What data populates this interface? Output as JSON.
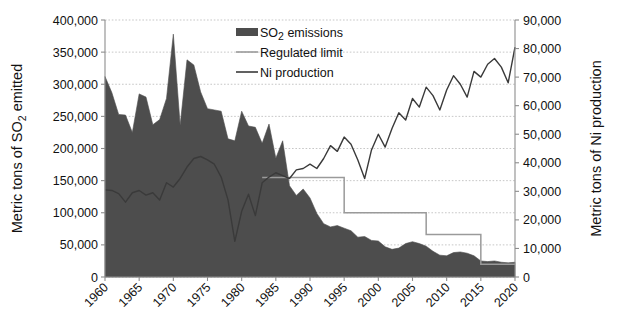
{
  "chart_data": {
    "type": "area",
    "title": "",
    "xlabel": "",
    "ylabel": "Metric tons of SO2 emitted",
    "ylabel_html": "Metric tons of SO₂ emitted",
    "y2label": "Metric tons of Ni production",
    "grid": true,
    "legend_position": "top-center-right",
    "xlim": [
      1960,
      2020
    ],
    "ylim": [
      0,
      400000
    ],
    "y2lim": [
      0,
      90000
    ],
    "xticks": [
      1960,
      1965,
      1970,
      1975,
      1980,
      1985,
      1990,
      1995,
      2000,
      2005,
      2010,
      2015,
      2020
    ],
    "xtick_labels": [
      "1960",
      "1965",
      "1970",
      "1975",
      "1980",
      "1985",
      "1990",
      "1995",
      "2000",
      "2005",
      "2010",
      "2015",
      "2020"
    ],
    "yticks": [
      0,
      50000,
      100000,
      150000,
      200000,
      250000,
      300000,
      350000,
      400000
    ],
    "ytick_labels": [
      "0",
      "50,000",
      "100,000",
      "150,000",
      "200,000",
      "250,000",
      "300,000",
      "350,000",
      "400,000"
    ],
    "y2ticks": [
      0,
      10000,
      20000,
      30000,
      40000,
      50000,
      60000,
      70000,
      80000,
      90000
    ],
    "y2tick_labels": [
      "0",
      "10,000",
      "20,000",
      "30,000",
      "40,000",
      "50,000",
      "60,000",
      "70,000",
      "80,000",
      "90,000"
    ],
    "x": [
      1960,
      1961,
      1962,
      1963,
      1964,
      1965,
      1966,
      1967,
      1968,
      1969,
      1970,
      1971,
      1972,
      1973,
      1974,
      1975,
      1976,
      1977,
      1978,
      1979,
      1980,
      1981,
      1982,
      1983,
      1984,
      1985,
      1986,
      1987,
      1988,
      1989,
      1990,
      1991,
      1992,
      1993,
      1994,
      1995,
      1996,
      1997,
      1998,
      1999,
      2000,
      2001,
      2002,
      2003,
      2004,
      2005,
      2006,
      2007,
      2008,
      2009,
      2010,
      2011,
      2012,
      2013,
      2014,
      2015,
      2016,
      2017,
      2018,
      2019,
      2020
    ],
    "series": [
      {
        "name": "SO2 emissions",
        "label": "SO₂ emissions",
        "type": "area",
        "axis": "left",
        "color": "#4d4d4d",
        "values": [
          312000,
          287000,
          253000,
          252000,
          225000,
          285000,
          280000,
          237000,
          245000,
          278000,
          378000,
          236000,
          338000,
          330000,
          288000,
          262000,
          260000,
          258000,
          215000,
          212000,
          258000,
          235000,
          233000,
          208000,
          238000,
          185000,
          212000,
          142000,
          127000,
          137000,
          123000,
          99000,
          83000,
          78000,
          80000,
          76000,
          72000,
          62000,
          63000,
          57000,
          56000,
          47000,
          43000,
          45000,
          52000,
          55000,
          52000,
          48000,
          40000,
          34000,
          33000,
          38000,
          39000,
          37000,
          33000,
          25000,
          24000,
          25000,
          23000,
          22000,
          23000
        ]
      },
      {
        "name": "Regulated limit",
        "label": "Regulated limit",
        "type": "step",
        "axis": "left",
        "color": "#9a9a9a",
        "x": [
          1983,
          1984,
          1985,
          1986,
          1987,
          1988,
          1989,
          1990,
          1991,
          1992,
          1993,
          1994,
          1995,
          1996,
          1997,
          1998,
          1999,
          2000,
          2001,
          2002,
          2003,
          2004,
          2005,
          2006,
          2007,
          2008,
          2009,
          2010,
          2011,
          2012,
          2013,
          2014,
          2015,
          2016,
          2017,
          2018,
          2019,
          2020
        ],
        "values": [
          155000,
          155000,
          155000,
          155000,
          155000,
          155000,
          155000,
          155000,
          155000,
          155000,
          155000,
          155000,
          100000,
          100000,
          100000,
          100000,
          100000,
          100000,
          100000,
          100000,
          100000,
          100000,
          100000,
          100000,
          66000,
          66000,
          66000,
          66000,
          66000,
          66000,
          66000,
          66000,
          20000,
          20000,
          20000,
          20000,
          20000,
          20000
        ]
      },
      {
        "name": "Ni production",
        "label": "Ni production",
        "type": "line",
        "axis": "right",
        "color": "#3a3a3a",
        "values": [
          30500,
          30300,
          29200,
          26200,
          29500,
          30300,
          28700,
          29500,
          27000,
          33000,
          31500,
          34500,
          38500,
          41500,
          42200,
          41000,
          39500,
          35000,
          27000,
          12500,
          23000,
          29000,
          21500,
          33000,
          35000,
          36500,
          35500,
          34500,
          37500,
          38000,
          39500,
          38000,
          41500,
          46000,
          44000,
          49000,
          46500,
          41000,
          34500,
          44500,
          50000,
          45500,
          52000,
          57500,
          55000,
          62500,
          59500,
          66500,
          63500,
          58500,
          65500,
          70500,
          67500,
          63000,
          72000,
          70000,
          74500,
          76500,
          73500,
          68000,
          80500
        ]
      }
    ]
  },
  "legend": {
    "items": [
      {
        "label": "SO₂ emissions",
        "marker": "swatch",
        "color": "#4d4d4d"
      },
      {
        "label": "Regulated limit",
        "marker": "line",
        "color": "#9a9a9a"
      },
      {
        "label": "Ni production",
        "marker": "line",
        "color": "#3a3a3a"
      }
    ]
  }
}
